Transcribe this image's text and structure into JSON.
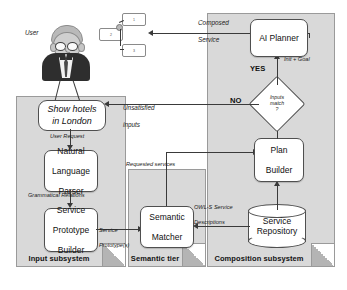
{
  "diagram": {
    "actor": {
      "label": "User",
      "icon": "user-avatar-icon",
      "utterance_line1": "Show hotels",
      "utterance_line2": "in London"
    },
    "composed_service": {
      "label_line1": "Composed",
      "label_line2": "Service",
      "nodes": [
        {
          "id": "1",
          "label": "1"
        },
        {
          "id": "2",
          "label": "2"
        },
        {
          "id": "3",
          "label": "3"
        }
      ]
    },
    "subsystems": [
      {
        "id": "input",
        "label": "Input subsystem"
      },
      {
        "id": "semantic",
        "label": "Semantic tier"
      },
      {
        "id": "composition",
        "label": "Composition subsystem"
      }
    ],
    "nodes": [
      {
        "id": "nlp",
        "label_line1": "Natural",
        "label_line2": "Language",
        "label_line3": "Parser"
      },
      {
        "id": "spb",
        "label_line1": "Service",
        "label_line2": "Prototype",
        "label_line3": "Builder"
      },
      {
        "id": "matcher",
        "label_line1": "Semantic",
        "label_line2": "Matcher",
        "label_line3": ""
      },
      {
        "id": "planner",
        "label_line1": "AI Planner",
        "label_line2": "",
        "label_line3": ""
      },
      {
        "id": "plan",
        "label_line1": "Plan",
        "label_line2": "Builder",
        "label_line3": ""
      },
      {
        "id": "repository",
        "label_line1": "Service",
        "label_line2": "Repository",
        "label_line3": ""
      }
    ],
    "decision": {
      "id": "inputs-match",
      "line1": "Inputs",
      "line2": "match",
      "line3": "?",
      "branch_yes": "YES",
      "branch_no": "NO"
    },
    "edge_labels": {
      "user_request": "User  Request",
      "grammatical_relations": "Grammatical  Relations",
      "service_prototypes_l1": "Service",
      "service_prototypes_l2": "Prototype(s)",
      "requested_services": "Requested  services",
      "owls_l1": "OWL-S Service",
      "owls_l2": "Descriptions",
      "unsatisfied_l1": "Unsatisfied",
      "unsatisfied_l2": "inputs",
      "init_goal": "Init + Goal",
      "composed_l1": "Composed",
      "composed_l2": "Service"
    },
    "colors": {
      "panel_fill": "#d9d9d9",
      "panel_stroke": "#9a9a9a",
      "node_fill": "#ffffff",
      "node_stroke": "#4f4f4f",
      "connector": "#3a3a3a",
      "text": "#111111"
    }
  }
}
